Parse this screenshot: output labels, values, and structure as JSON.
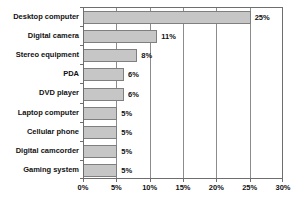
{
  "chart_data": {
    "type": "bar",
    "orientation": "horizontal",
    "title": "",
    "xlabel": "",
    "ylabel": "",
    "categories": [
      "Desktop computer",
      "Digital camera",
      "Stereo equipment",
      "PDA",
      "DVD player",
      "Laptop computer",
      "Cellular phone",
      "Digital camcorder",
      "Gaming system"
    ],
    "values": [
      25,
      11,
      8,
      6,
      6,
      5,
      5,
      5,
      5
    ],
    "value_labels": [
      "25%",
      "11%",
      "8%",
      "6%",
      "6%",
      "5%",
      "5%",
      "5%",
      "5%"
    ],
    "x_tick_labels": [
      "0%",
      "5%",
      "10%",
      "15%",
      "20%",
      "25%",
      "30%"
    ],
    "x_tick_values": [
      0,
      5,
      10,
      15,
      20,
      25,
      30
    ],
    "xlim": [
      0,
      30
    ],
    "grid": "vertical",
    "legend": "none"
  },
  "colors": {
    "bar_fill": "#c6c6c6",
    "bar_border": "#7f7f7f",
    "gridline": "#8c8c8c",
    "frame": "#6e6e6e",
    "text": "#111111",
    "background": "#ffffff"
  }
}
